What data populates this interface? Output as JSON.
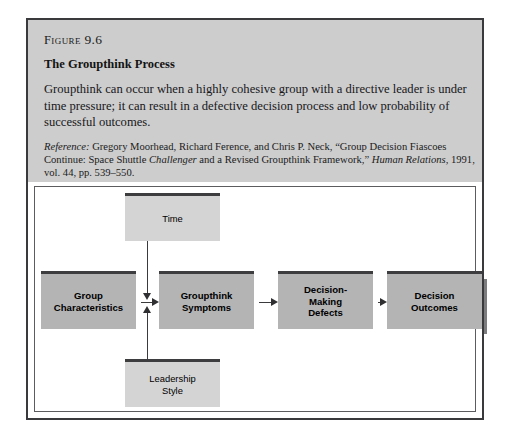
{
  "figure": {
    "label_prefix": "Figure",
    "label_number": "9.6",
    "title": "The Groupthink Process",
    "body": "Groupthink can occur when a highly cohesive group with a directive leader is under time pressure; it can result in a defective decision process and low probability of successful outcomes.",
    "reference": {
      "lead_italic": "Reference:",
      "part1": " Gregory Moorhead, Richard Ference, and Chris P. Neck, “Group Decision Fiascoes Continue: Space Shuttle ",
      "italic1": "Challenger",
      "part2": " and a Revised Groupthink Framework,” ",
      "italic2": "Human Relations",
      "part3": ", 1991, vol. 44, pp. 539–550."
    }
  },
  "diagram": {
    "type": "flow",
    "nodes": [
      {
        "id": "time",
        "label": "Time",
        "style": "light",
        "x": 90,
        "y": 6,
        "w": 95,
        "h": 48
      },
      {
        "id": "group-chars",
        "label": "Group\nCharacteristics",
        "style": "main",
        "x": 6,
        "y": 84,
        "w": 95,
        "h": 58
      },
      {
        "id": "leadership",
        "label": "Leadership\nStyle",
        "style": "light",
        "x": 90,
        "y": 172,
        "w": 95,
        "h": 48
      },
      {
        "id": "symptoms",
        "label": "Groupthink\nSymptoms",
        "style": "main",
        "x": 124,
        "y": 84,
        "w": 95,
        "h": 58
      },
      {
        "id": "defects",
        "label": "Decision-\nMaking\nDefects",
        "style": "main",
        "x": 243,
        "y": 84,
        "w": 95,
        "h": 58
      },
      {
        "id": "outcomes",
        "label": "Decision\nOutcomes",
        "style": "main",
        "x": 352,
        "y": 84,
        "w": 95,
        "h": 58
      }
    ],
    "edges": [
      {
        "from": "group-chars",
        "to": "symptoms",
        "dir": "right"
      },
      {
        "from": "time",
        "to": "symptoms",
        "dir": "down"
      },
      {
        "from": "leadership",
        "to": "symptoms",
        "dir": "up"
      },
      {
        "from": "symptoms",
        "to": "defects",
        "dir": "right"
      },
      {
        "from": "defects",
        "to": "outcomes",
        "dir": "right"
      }
    ]
  }
}
